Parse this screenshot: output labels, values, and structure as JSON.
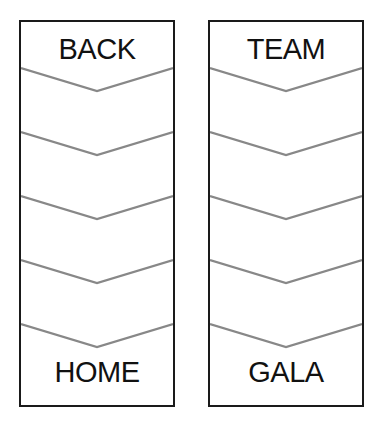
{
  "columns": [
    {
      "top_label": "BACK",
      "bottom_label": "HOME"
    },
    {
      "top_label": "TEAM",
      "bottom_label": "GALA"
    }
  ],
  "chevron_count": 5,
  "colors": {
    "border": "#1a1a1a",
    "chevron": "#888888",
    "text": "#111111"
  }
}
